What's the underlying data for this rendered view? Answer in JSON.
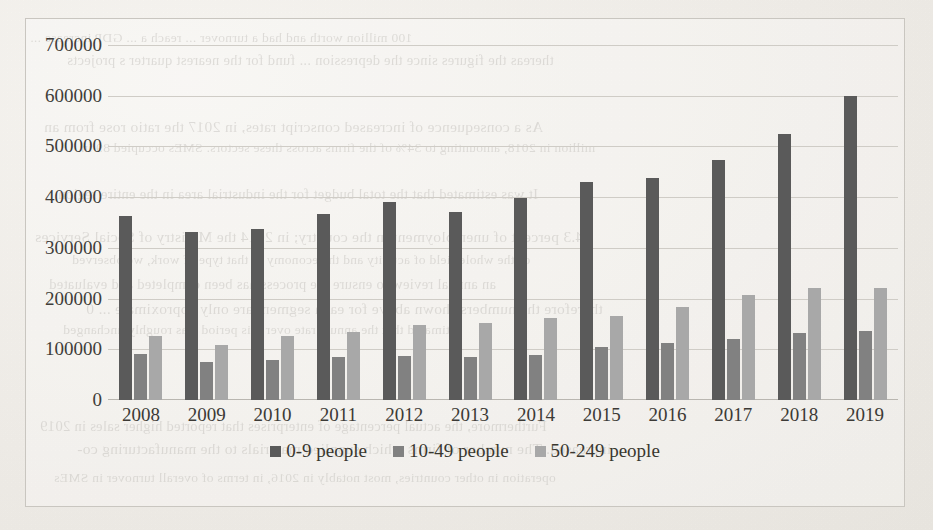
{
  "chart_data": {
    "type": "bar",
    "title": "",
    "subtitle": "",
    "xlabel": "",
    "ylabel": "",
    "grid": true,
    "legend_position": "bottom",
    "ylim": [
      0,
      700000
    ],
    "ytick_step": 100000,
    "yticks": [
      "700000",
      "600000",
      "500000",
      "400000",
      "300000",
      "200000",
      "100000",
      "0"
    ],
    "ytick_values": [
      700000,
      600000,
      500000,
      400000,
      300000,
      200000,
      100000,
      0
    ],
    "categories": [
      "2008",
      "2009",
      "2010",
      "2011",
      "2012",
      "2013",
      "2014",
      "2015",
      "2016",
      "2017",
      "2018",
      "2019"
    ],
    "series": [
      {
        "name": "0-9 people",
        "color": "#5a5a5a",
        "values": [
          363000,
          332000,
          337000,
          367000,
          390000,
          371000,
          399000,
          429000,
          437000,
          474000,
          525000,
          600000
        ]
      },
      {
        "name": "10-49 people",
        "color": "#818181",
        "values": [
          91000,
          75000,
          79000,
          85000,
          86000,
          85000,
          89000,
          104000,
          112000,
          120000,
          132000,
          136000
        ]
      },
      {
        "name": "50-249 people",
        "color": "#a8a8a8",
        "values": [
          127000,
          109000,
          127000,
          134000,
          148000,
          152000,
          161000,
          166000,
          184000,
          208000,
          221000,
          221000
        ]
      }
    ]
  },
  "legend": {
    "items": [
      {
        "label": "0-9 people",
        "color": "#5a5a5a"
      },
      {
        "label": "10-49 people",
        "color": "#818181"
      },
      {
        "label": "50-249 people",
        "color": "#a8a8a8"
      }
    ]
  },
  "background_bleed_text": {
    "lines": [
      "100 million  worth  and  had a turnover ... reach a ... GDP  increase ...",
      "thereas the figures since the  depression  ... fund for the nearest quarter s projects",
      "As  a consequence of  increased  conscript rates, in  2017  the  ratio  rose  from  an",
      "million in 2018, amounting to 34% of the firms across these sectors. SMEs occupied 89 in",
      "It  was estimated that  the  total  budget for the  industrial area in  the  entire region",
      "I  4.3 percent of unemployment in  the  country;  in  2014  the  Ministry of Social Services",
      "of the whole field of activity and the economy in that type of work, we observed",
      "an  annual  review  to  ensure  the  process  has  been  completed  and  evaluated",
      "therefore the numbers shown above for each segment are only approximate ... 0",
      "estimated that the annual rate over this period was roughly unchanged",
      "Furthermore, the actual percentage of enterprises that reported higher sales in 2019",
      "increased. The number of firms which supplied materials to the manufacturing co-",
      "operation in other countries, most notably in 2016, in terms of overall turnover in SMEs"
    ]
  }
}
